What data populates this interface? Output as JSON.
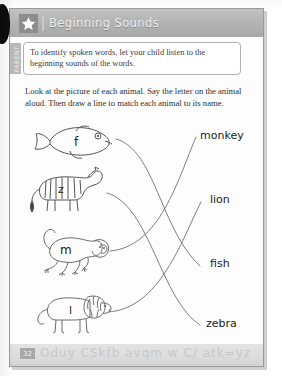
{
  "worksheet": {
    "title": "Beginning Sounds",
    "star_icon": "star-icon",
    "page_number": "32",
    "footer_letters": "Oduy CSkfb avqm w C/ atk=yz"
  },
  "parent_tip": {
    "tab_label": "PARENT",
    "text": "To identify spoken words, let your child listen to the beginning sounds of the words."
  },
  "directions": {
    "text": "Look at the picture of each animal. Say the letter on the animal aloud. Then draw a line to match each animal to its name."
  },
  "activity": {
    "animals": [
      {
        "name": "fish",
        "letter": "f",
        "icon": "fish-icon"
      },
      {
        "name": "zebra",
        "letter": "z",
        "icon": "zebra-icon"
      },
      {
        "name": "monkey",
        "letter": "m",
        "icon": "monkey-icon"
      },
      {
        "name": "lion",
        "letter": "l",
        "icon": "lion-icon"
      }
    ],
    "words": [
      {
        "label": "monkey"
      },
      {
        "label": "lion"
      },
      {
        "label": "fish"
      },
      {
        "label": "zebra"
      }
    ]
  },
  "colors": {
    "title_bar": "#b4b4b4",
    "title_text": "#ededed",
    "star_badge": "#8d8d8d",
    "footer": "#dcdcdc",
    "line_stroke": "#707070",
    "sheet_border": "#9a9a9a"
  }
}
